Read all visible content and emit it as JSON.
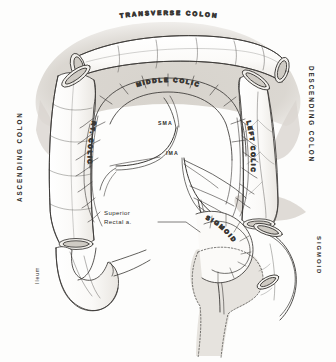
{
  "figure": {
    "style": "pen-and-ink anatomical line drawing with warm-gray wash",
    "colors": {
      "ink": "#2b2a28",
      "line": "#4a4845",
      "wash": "#d8d4ce",
      "wash_light": "#e6e3de",
      "paper": "#fdfdfc",
      "lumen": "#f3f1ed"
    }
  },
  "labels": {
    "transverse_colon": "TRANSVERSE COLON",
    "ascending_colon": "ASCENDING COLON",
    "descending_colon": "DESCENDING COLON",
    "middle_colic": "MIDDLE COLIC",
    "right_colic": "RT. COLIC",
    "left_colic": "LEFT COLIC",
    "sma": "SMA",
    "ima": "IMA",
    "superior_rectal_line1": "Superior",
    "superior_rectal_line2": "Rectal a.",
    "sigmoid_inner": "SIGMOID",
    "sigmoid_outer": "SIGMOID",
    "ileum": "Ileum"
  }
}
